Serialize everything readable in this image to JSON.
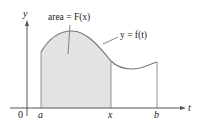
{
  "diagram": {
    "axes": {
      "vertical_label": "y",
      "horizontal_label": "t",
      "origin_label": "0"
    },
    "ticks": {
      "a": "a",
      "x": "x",
      "b": "b"
    },
    "annotations": {
      "area_label": "area = F(x)",
      "curve_label": "y = f(t)"
    },
    "colors": {
      "shaded_region": "#e3e3e3",
      "curve": "#777777",
      "axes": "#555555",
      "text": "#222222"
    }
  }
}
